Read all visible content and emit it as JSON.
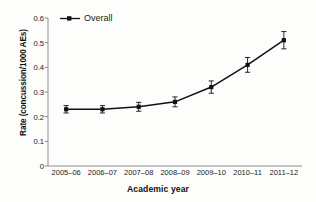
{
  "chart_data": {
    "type": "line",
    "title": "",
    "xlabel": "Academic year",
    "ylabel": "Rate (concussion/1000 AEs)",
    "categories": [
      "2005–06",
      "2006–07",
      "2007–08",
      "2008–09",
      "2009–10",
      "2010–11",
      "2011–12"
    ],
    "series": [
      {
        "name": "Overall",
        "values": [
          0.23,
          0.23,
          0.24,
          0.26,
          0.32,
          0.41,
          0.51
        ],
        "error_low": [
          0.215,
          0.215,
          0.222,
          0.24,
          0.295,
          0.38,
          0.475
        ],
        "error_high": [
          0.245,
          0.245,
          0.258,
          0.28,
          0.345,
          0.44,
          0.545
        ],
        "color": "#111111",
        "marker": "square"
      }
    ],
    "ylim": [
      0,
      0.6
    ],
    "yticks": [
      0,
      0.1,
      0.2,
      0.3,
      0.4,
      0.5,
      0.6
    ],
    "ytick_labels": [
      "0",
      "0.1",
      "0.2",
      "0.3",
      "0.4",
      "0.5",
      "0.6"
    ],
    "grid": false,
    "legend_position": "top-left",
    "frame": "left-bottom"
  },
  "legend": {
    "entries": [
      {
        "label": "Overall",
        "symbol": "line-with-marker"
      }
    ]
  },
  "colors": {
    "line": "#111111",
    "axis": "#8c8c8c",
    "text": "#1a1a1a",
    "background": "#fdfdfc"
  }
}
